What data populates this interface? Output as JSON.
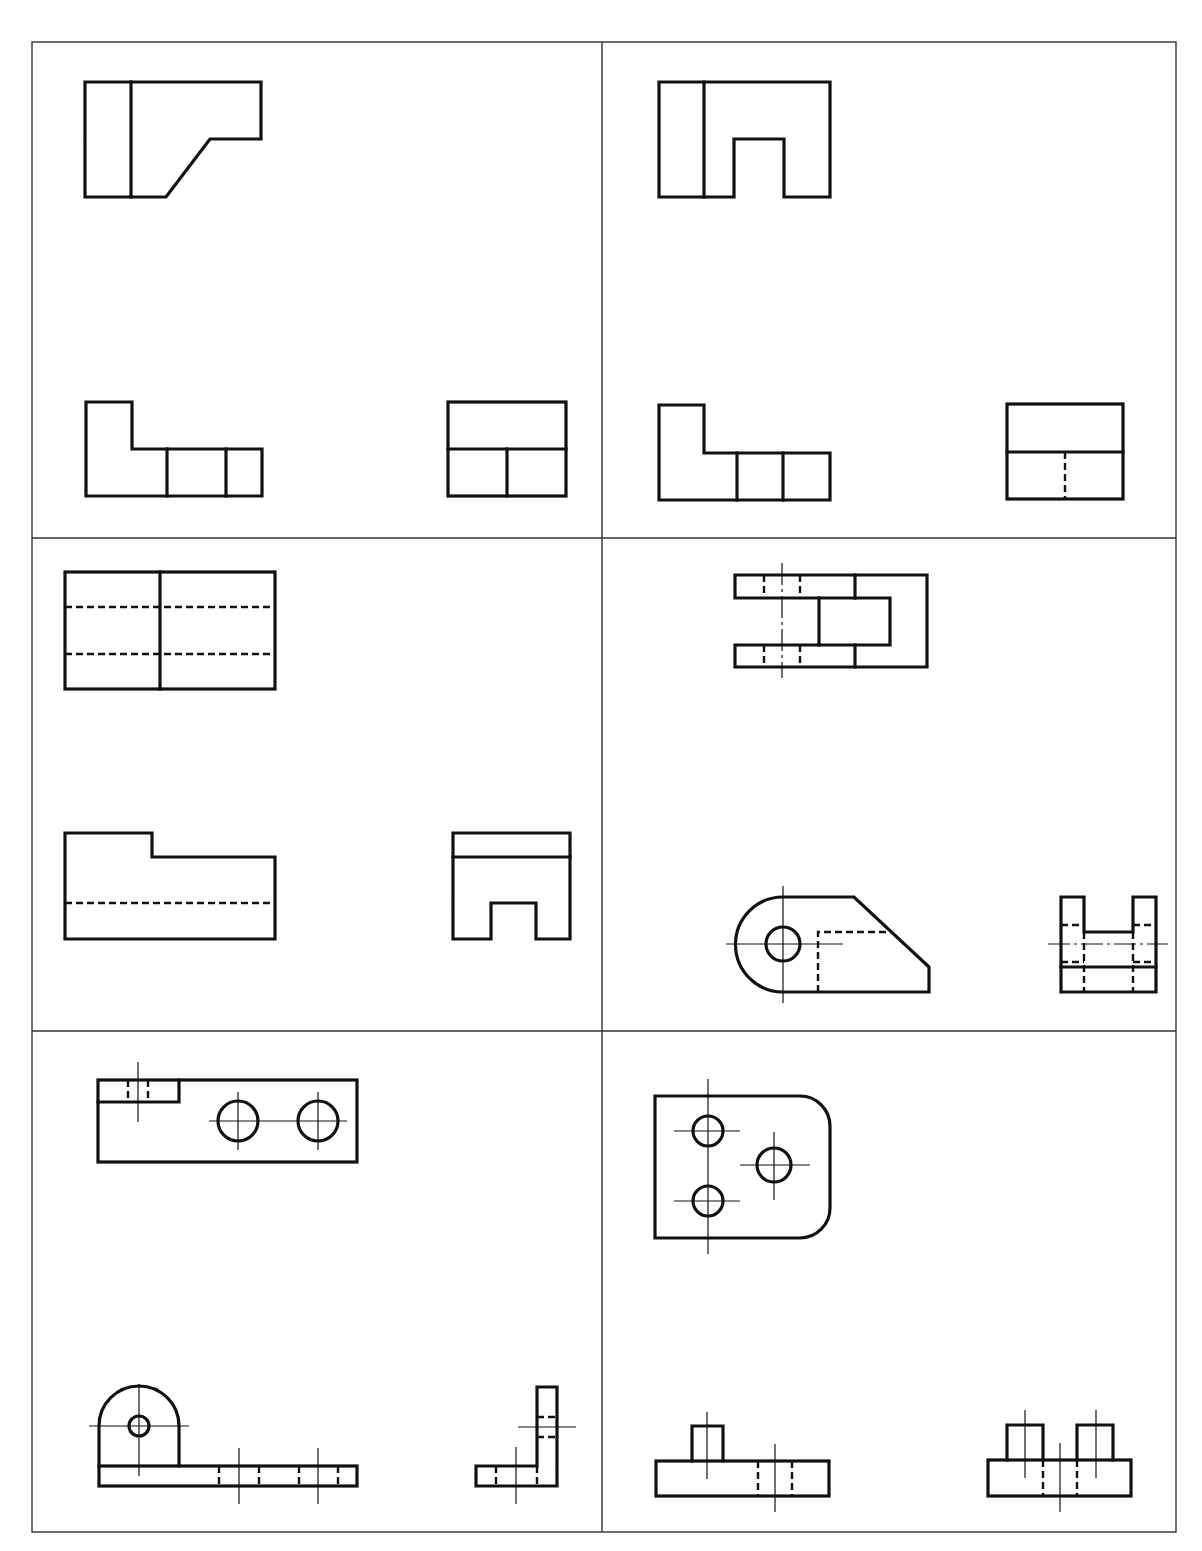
{
  "page": {
    "title_cutoff": ""
  },
  "colors": {
    "line": "#111111",
    "grid": "#333333",
    "background": "#ffffff"
  },
  "grid": {
    "columns": 2,
    "rows": 3,
    "left": 32,
    "right": 1176,
    "top": 42,
    "bottom": 1532,
    "col_split": 602,
    "row_splits": [
      538,
      1031
    ]
  },
  "exercises": [
    {
      "id": 1,
      "position": "row1-left",
      "views": [
        "top",
        "front",
        "side"
      ],
      "features": [
        "chamfered corner",
        "L-shaped front",
        "vertical divisions"
      ]
    },
    {
      "id": 2,
      "position": "row1-right",
      "views": [
        "top",
        "front",
        "side"
      ],
      "features": [
        "rectangular notch",
        "L-shaped front",
        "hidden line in side view"
      ]
    },
    {
      "id": 3,
      "position": "row2-left",
      "views": [
        "top",
        "front",
        "side"
      ],
      "features": [
        "two hidden lines in top",
        "stepped front",
        "slot in side view"
      ]
    },
    {
      "id": 4,
      "position": "row2-right",
      "views": [
        "top",
        "front",
        "side"
      ],
      "features": [
        "U-shaped fork",
        "round boss with hole",
        "angled face"
      ]
    },
    {
      "id": 5,
      "position": "row3-left",
      "views": [
        "top",
        "front",
        "side"
      ],
      "features": [
        "two holes",
        "rounded upright with hole",
        "L-bracket side"
      ]
    },
    {
      "id": 6,
      "position": "row3-right",
      "views": [
        "top",
        "front",
        "side"
      ],
      "features": [
        "rounded plate with three holes",
        "bosses"
      ]
    }
  ]
}
